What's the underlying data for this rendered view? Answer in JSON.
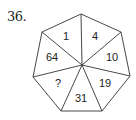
{
  "question": {
    "number": "36."
  },
  "puzzle": {
    "shape": "heptagon",
    "center": [
      82,
      65
    ],
    "vertices": [
      [
        81,
        14
      ],
      [
        121,
        32
      ],
      [
        130,
        76
      ],
      [
        102,
        111
      ],
      [
        61,
        111
      ],
      [
        33,
        77
      ],
      [
        42,
        32
      ]
    ],
    "segments": [
      {
        "label": "1",
        "pos": [
          66,
          37
        ]
      },
      {
        "label": "4",
        "pos": [
          95,
          37
        ]
      },
      {
        "label": "10",
        "pos": [
          112,
          58
        ]
      },
      {
        "label": "19",
        "pos": [
          105,
          84
        ]
      },
      {
        "label": "31",
        "pos": [
          81,
          99
        ]
      },
      {
        "label": "?",
        "pos": [
          58,
          84
        ]
      },
      {
        "label": "64",
        "pos": [
          52,
          58
        ]
      }
    ]
  },
  "colors": {
    "stroke": "#333333",
    "text": "#222222",
    "background": "#ffffff"
  }
}
